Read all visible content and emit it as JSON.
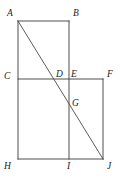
{
  "figure": {
    "stroke_color": "#3a3a3a",
    "label_color": "#222222",
    "background_color": "#ffffff",
    "width": 120,
    "height": 184,
    "vertices": [
      {
        "id": "A",
        "label": "A",
        "x": 18,
        "y": 21,
        "label_x": 7,
        "label_y": 9
      },
      {
        "id": "B",
        "label": "B",
        "x": 69,
        "y": 21,
        "label_x": 73,
        "label_y": 9
      },
      {
        "id": "C",
        "label": "C",
        "x": 18,
        "y": 79,
        "label_x": 4,
        "label_y": 72
      },
      {
        "id": "D",
        "label": "D",
        "x": 53,
        "y": 79,
        "label_x": 56,
        "label_y": 70
      },
      {
        "id": "E",
        "label": "E",
        "x": 69,
        "y": 79,
        "label_x": 71,
        "label_y": 70
      },
      {
        "id": "F",
        "label": "F",
        "x": 103,
        "y": 79,
        "label_x": 107,
        "label_y": 70
      },
      {
        "id": "G",
        "label": "G",
        "x": 69,
        "y": 104,
        "label_x": 72,
        "label_y": 99
      },
      {
        "id": "H",
        "label": "H",
        "x": 18,
        "y": 159,
        "label_x": 4,
        "label_y": 162
      },
      {
        "id": "I",
        "label": "I",
        "x": 69,
        "y": 159,
        "label_x": 67,
        "label_y": 162
      },
      {
        "id": "J",
        "label": "J",
        "x": 103,
        "y": 159,
        "label_x": 107,
        "label_y": 162
      }
    ],
    "segments": [
      {
        "id": "AB",
        "name": "segment-ab",
        "x1": 18,
        "y1": 21,
        "x2": 69,
        "y2": 21
      },
      {
        "id": "AH",
        "name": "segment-ah",
        "x1": 18,
        "y1": 21,
        "x2": 18,
        "y2": 159
      },
      {
        "id": "BI",
        "name": "segment-bi",
        "x1": 69,
        "y1": 21,
        "x2": 69,
        "y2": 159
      },
      {
        "id": "CF",
        "name": "segment-cf",
        "x1": 18,
        "y1": 79,
        "x2": 103,
        "y2": 79
      },
      {
        "id": "FJ",
        "name": "segment-fj",
        "x1": 103,
        "y1": 79,
        "x2": 103,
        "y2": 159
      },
      {
        "id": "HJ",
        "name": "segment-hj",
        "x1": 18,
        "y1": 159,
        "x2": 103,
        "y2": 159
      }
    ],
    "diagonal": {
      "id": "AJ",
      "name": "diagonal-aj",
      "x1": 18,
      "y1": 21,
      "x2": 103,
      "y2": 159
    }
  }
}
